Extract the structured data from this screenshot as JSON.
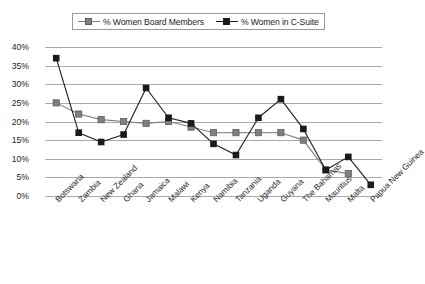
{
  "chart_data": {
    "type": "line",
    "title": "",
    "xlabel": "",
    "ylabel": "",
    "ylim": [
      0,
      40
    ],
    "ytick_labels": [
      "40%",
      "35%",
      "30%",
      "25%",
      "20%",
      "15%",
      "10%",
      "5%",
      "0%"
    ],
    "ytick_values": [
      40,
      35,
      30,
      25,
      20,
      15,
      10,
      5,
      0
    ],
    "grid": true,
    "legend_position": "top-center",
    "categories": [
      "Botswana",
      "Zambia",
      "New Zealand",
      "Ghana",
      "Jamaica",
      "Malawi",
      "Kenya",
      "Namibia",
      "Tanzania",
      "Uganda",
      "Guyana",
      "The Bahamas",
      "Mauritius",
      "Malta",
      "Papua New Guinea"
    ],
    "series": [
      {
        "name": "% Women Board Members",
        "color": "#7f7f7f",
        "marker": "square",
        "values": [
          25,
          22,
          20.5,
          20,
          19.5,
          20,
          18.5,
          17,
          17,
          17,
          17,
          15,
          7,
          6,
          null
        ]
      },
      {
        "name": "% Women in C-Suite",
        "color": "#1a1a1a",
        "marker": "square",
        "values": [
          37,
          17,
          14.5,
          16.5,
          29,
          21,
          19.5,
          14,
          11,
          21,
          26,
          18,
          7,
          10.5,
          3
        ]
      }
    ]
  },
  "legend": {
    "entries": [
      {
        "label": "% Women Board Members",
        "color": "#7f7f7f"
      },
      {
        "label": "% Women in C-Suite",
        "color": "#1a1a1a"
      }
    ]
  },
  "colors": {
    "board_members": "#7f7f7f",
    "c_suite": "#1a1a1a",
    "gridline": "#aaaaaa",
    "background": "#ffffff",
    "axis_text": "#232323"
  }
}
